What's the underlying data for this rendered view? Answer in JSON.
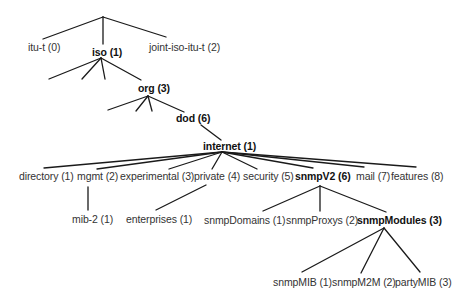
{
  "diagram": {
    "type": "tree",
    "title": "",
    "line_color": "#1a1a1a",
    "text_color": "#333333",
    "nodes": [
      {
        "id": "itu",
        "label": "itu-t (0)",
        "x": 28,
        "y": 41,
        "bold": false
      },
      {
        "id": "iso",
        "label": "iso (1)",
        "x": 92,
        "y": 46,
        "bold": true
      },
      {
        "id": "joint",
        "label": "joint-iso-itu-t (2)",
        "x": 149,
        "y": 41,
        "bold": false
      },
      {
        "id": "org",
        "label": "org (3)",
        "x": 138,
        "y": 82,
        "bold": true
      },
      {
        "id": "dod",
        "label": "dod (6)",
        "x": 176,
        "y": 112,
        "bold": true
      },
      {
        "id": "internet",
        "label": "internet (1)",
        "x": 203,
        "y": 140,
        "bold": true
      },
      {
        "id": "directory",
        "label": "directory (1)",
        "x": 19,
        "y": 170,
        "bold": false
      },
      {
        "id": "mgmt",
        "label": "mgmt (2)",
        "x": 77,
        "y": 170,
        "bold": false
      },
      {
        "id": "experimental",
        "label": "experimental (3)",
        "x": 120,
        "y": 170,
        "bold": false
      },
      {
        "id": "private",
        "label": "private (4)",
        "x": 194,
        "y": 170,
        "bold": false
      },
      {
        "id": "security",
        "label": "security (5)",
        "x": 243,
        "y": 170,
        "bold": false
      },
      {
        "id": "snmpV2",
        "label": "snmpV2 (6)",
        "x": 295,
        "y": 170,
        "bold": true
      },
      {
        "id": "mail",
        "label": "mail (7)",
        "x": 356,
        "y": 170,
        "bold": false
      },
      {
        "id": "features",
        "label": "features (8)",
        "x": 391,
        "y": 170,
        "bold": false
      },
      {
        "id": "mib2",
        "label": "mib-2 (1)",
        "x": 72,
        "y": 213,
        "bold": false
      },
      {
        "id": "enterprises",
        "label": "enterprises (1)",
        "x": 126,
        "y": 213,
        "bold": false
      },
      {
        "id": "snmpDomains",
        "label": "snmpDomains (1)",
        "x": 204,
        "y": 214,
        "bold": false
      },
      {
        "id": "snmpProxys",
        "label": "snmpProxys (2)",
        "x": 286,
        "y": 214,
        "bold": false
      },
      {
        "id": "snmpModules",
        "label": "snmpModules (3)",
        "x": 357,
        "y": 214,
        "bold": true
      },
      {
        "id": "snmpMIB",
        "label": "snmpMIB (1)",
        "x": 273,
        "y": 276,
        "bold": false
      },
      {
        "id": "snmpM2M",
        "label": "snmpM2M (2)",
        "x": 332,
        "y": 276,
        "bold": false
      },
      {
        "id": "partyMIB",
        "label": "partyMIB (3)",
        "x": 395,
        "y": 276,
        "bold": false
      }
    ],
    "edges": [
      {
        "from": "root",
        "to": "itu",
        "x1": 103,
        "y1": 17,
        "x2": 43,
        "y2": 39
      },
      {
        "from": "root",
        "to": "iso",
        "x1": 103,
        "y1": 17,
        "x2": 103,
        "y2": 44
      },
      {
        "from": "root",
        "to": "joint",
        "x1": 103,
        "y1": 17,
        "x2": 166,
        "y2": 37
      },
      {
        "from": "iso",
        "to": "unnamed-1",
        "x1": 101,
        "y1": 58,
        "x2": 49,
        "y2": 79
      },
      {
        "from": "iso",
        "to": "unnamed-2",
        "x1": 101,
        "y1": 58,
        "x2": 82,
        "y2": 79
      },
      {
        "from": "iso",
        "to": "unnamed-3",
        "x1": 101,
        "y1": 58,
        "x2": 105,
        "y2": 79
      },
      {
        "from": "iso",
        "to": "org",
        "x1": 101,
        "y1": 58,
        "x2": 141,
        "y2": 80
      },
      {
        "from": "org",
        "to": "unnamed-4",
        "x1": 148,
        "y1": 96,
        "x2": 108,
        "y2": 110
      },
      {
        "from": "org",
        "to": "unnamed-5",
        "x1": 148,
        "y1": 96,
        "x2": 136,
        "y2": 111
      },
      {
        "from": "org",
        "to": "unnamed-6",
        "x1": 148,
        "y1": 96,
        "x2": 152,
        "y2": 111
      },
      {
        "from": "org",
        "to": "dod",
        "x1": 148,
        "y1": 96,
        "x2": 184,
        "y2": 112
      },
      {
        "from": "dod",
        "to": "internet",
        "x1": 201,
        "y1": 125,
        "x2": 221,
        "y2": 140
      },
      {
        "from": "internet",
        "to": "directory",
        "x1": 222,
        "y1": 152,
        "x2": 44,
        "y2": 168
      },
      {
        "from": "internet",
        "to": "mgmt",
        "x1": 222,
        "y1": 152,
        "x2": 97,
        "y2": 169
      },
      {
        "from": "internet",
        "to": "experimental",
        "x1": 222,
        "y1": 152,
        "x2": 169,
        "y2": 169
      },
      {
        "from": "internet",
        "to": "private",
        "x1": 222,
        "y1": 152,
        "x2": 212,
        "y2": 169
      },
      {
        "from": "internet",
        "to": "security",
        "x1": 222,
        "y1": 152,
        "x2": 257,
        "y2": 169
      },
      {
        "from": "internet",
        "to": "snmpV2",
        "x1": 222,
        "y1": 152,
        "x2": 313,
        "y2": 168
      },
      {
        "from": "internet",
        "to": "mail",
        "x1": 222,
        "y1": 152,
        "x2": 364,
        "y2": 167
      },
      {
        "from": "internet",
        "to": "features",
        "x1": 222,
        "y1": 152,
        "x2": 416,
        "y2": 167
      },
      {
        "from": "mgmt",
        "to": "mib2",
        "x1": 88,
        "y1": 187,
        "x2": 88,
        "y2": 210
      },
      {
        "from": "private",
        "to": "enterprises",
        "x1": 206,
        "y1": 185,
        "x2": 156,
        "y2": 210
      },
      {
        "from": "snmpV2",
        "to": "snmpDomains",
        "x1": 320,
        "y1": 186,
        "x2": 263,
        "y2": 211
      },
      {
        "from": "snmpV2",
        "to": "snmpProxys",
        "x1": 320,
        "y1": 186,
        "x2": 320,
        "y2": 211
      },
      {
        "from": "snmpV2",
        "to": "snmpModules",
        "x1": 320,
        "y1": 186,
        "x2": 386,
        "y2": 212
      },
      {
        "from": "snmpModules",
        "to": "snmpMIB",
        "x1": 384,
        "y1": 228,
        "x2": 302,
        "y2": 272
      },
      {
        "from": "snmpModules",
        "to": "snmpM2M",
        "x1": 384,
        "y1": 228,
        "x2": 361,
        "y2": 273
      },
      {
        "from": "snmpModules",
        "to": "partyMIB",
        "x1": 384,
        "y1": 228,
        "x2": 420,
        "y2": 272
      }
    ]
  }
}
